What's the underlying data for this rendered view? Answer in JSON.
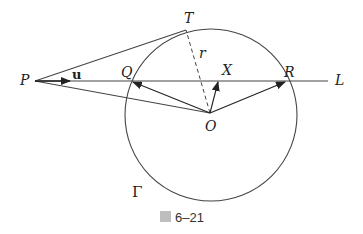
{
  "figure": {
    "caption_prefix": "圖",
    "caption_number": "6–21",
    "colors": {
      "stroke": "#333333",
      "background": "#ffffff"
    }
  },
  "labels": {
    "P": "P",
    "T": "T",
    "Q": "Q",
    "X": "X",
    "R": "R",
    "L": "L",
    "O": "O",
    "r": "r",
    "u": "u",
    "Gamma": "Γ"
  }
}
